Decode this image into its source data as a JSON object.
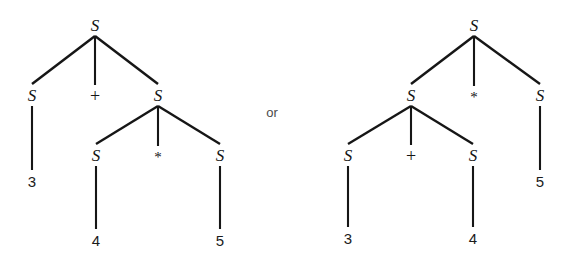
{
  "figure": {
    "background_color": "#ffffff",
    "stroke_color": "#161616",
    "text_color": "#141414",
    "connector": {
      "label": "or",
      "x": 272,
      "y": 112
    }
  },
  "trees": [
    {
      "id": "left-tree",
      "name": "parse-tree-left",
      "expression": "3 + 4 * 5",
      "nodes": [
        {
          "id": "L0",
          "label": "S",
          "kind": "nonterminal",
          "x": 95,
          "y": 25
        },
        {
          "id": "L1",
          "label": "S",
          "kind": "nonterminal",
          "x": 32,
          "y": 95
        },
        {
          "id": "L2",
          "label": "+",
          "kind": "operator",
          "x": 95,
          "y": 96
        },
        {
          "id": "L3",
          "label": "S",
          "kind": "nonterminal",
          "x": 158,
          "y": 95
        },
        {
          "id": "L4",
          "label": "3",
          "kind": "terminal",
          "x": 32,
          "y": 181
        },
        {
          "id": "L5",
          "label": "S",
          "kind": "nonterminal",
          "x": 96,
          "y": 155
        },
        {
          "id": "L6",
          "label": "*",
          "kind": "operator",
          "x": 158,
          "y": 157
        },
        {
          "id": "L7",
          "label": "S",
          "kind": "nonterminal",
          "x": 220,
          "y": 155
        },
        {
          "id": "L8",
          "label": "4",
          "kind": "terminal",
          "x": 96,
          "y": 240
        },
        {
          "id": "L9",
          "label": "5",
          "kind": "terminal",
          "x": 220,
          "y": 240
        }
      ],
      "edges": [
        {
          "from": "L0",
          "to": "L1"
        },
        {
          "from": "L0",
          "to": "L2"
        },
        {
          "from": "L0",
          "to": "L3"
        },
        {
          "from": "L1",
          "to": "L4"
        },
        {
          "from": "L3",
          "to": "L5"
        },
        {
          "from": "L3",
          "to": "L6"
        },
        {
          "from": "L3",
          "to": "L7"
        },
        {
          "from": "L5",
          "to": "L8"
        },
        {
          "from": "L7",
          "to": "L9"
        }
      ]
    },
    {
      "id": "right-tree",
      "name": "parse-tree-right",
      "expression": "3 + 4 * 5",
      "nodes": [
        {
          "id": "R0",
          "label": "S",
          "kind": "nonterminal",
          "x": 474,
          "y": 25
        },
        {
          "id": "R1",
          "label": "S",
          "kind": "nonterminal",
          "x": 411,
          "y": 95
        },
        {
          "id": "R2",
          "label": "*",
          "kind": "operator",
          "x": 474,
          "y": 97
        },
        {
          "id": "R3",
          "label": "S",
          "kind": "nonterminal",
          "x": 540,
          "y": 95
        },
        {
          "id": "R4",
          "label": "S",
          "kind": "nonterminal",
          "x": 348,
          "y": 155
        },
        {
          "id": "R5",
          "label": "+",
          "kind": "operator",
          "x": 411,
          "y": 156
        },
        {
          "id": "R6",
          "label": "S",
          "kind": "nonterminal",
          "x": 473,
          "y": 155
        },
        {
          "id": "R7",
          "label": "5",
          "kind": "terminal",
          "x": 540,
          "y": 181
        },
        {
          "id": "R8",
          "label": "3",
          "kind": "terminal",
          "x": 348,
          "y": 238
        },
        {
          "id": "R9",
          "label": "4",
          "kind": "terminal",
          "x": 473,
          "y": 238
        }
      ],
      "edges": [
        {
          "from": "R0",
          "to": "R1"
        },
        {
          "from": "R0",
          "to": "R2"
        },
        {
          "from": "R0",
          "to": "R3"
        },
        {
          "from": "R1",
          "to": "R4"
        },
        {
          "from": "R1",
          "to": "R5"
        },
        {
          "from": "R1",
          "to": "R6"
        },
        {
          "from": "R3",
          "to": "R7"
        },
        {
          "from": "R4",
          "to": "R8"
        },
        {
          "from": "R6",
          "to": "R9"
        }
      ]
    }
  ]
}
